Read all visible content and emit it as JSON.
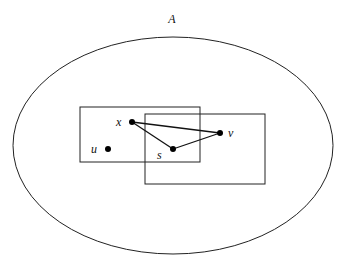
{
  "diagram": {
    "set_label": "A",
    "ellipse": {
      "cx": 173,
      "cy": 145.5,
      "rx": 160,
      "ry": 108.5
    },
    "rectangles": [
      {
        "name": "rect-left",
        "x": 80,
        "y": 107,
        "w": 120,
        "h": 55
      },
      {
        "name": "rect-right",
        "x": 145,
        "y": 114,
        "w": 120,
        "h": 70
      }
    ],
    "points": [
      {
        "id": "x",
        "label": "x",
        "cx": 132,
        "cy": 122,
        "lx": 116,
        "ly": 126
      },
      {
        "id": "u",
        "label": "u",
        "cx": 108,
        "cy": 149,
        "lx": 91,
        "ly": 153
      },
      {
        "id": "s",
        "label": "s",
        "cx": 173,
        "cy": 149,
        "lx": 157,
        "ly": 159
      },
      {
        "id": "v",
        "label": "v",
        "cx": 220,
        "cy": 133,
        "lx": 228,
        "ly": 137
      }
    ],
    "edges": [
      {
        "from": "x",
        "to": "v"
      },
      {
        "from": "x",
        "to": "s"
      },
      {
        "from": "s",
        "to": "v"
      }
    ]
  }
}
